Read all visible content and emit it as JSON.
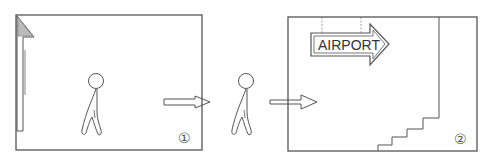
{
  "panels": [
    {
      "id": 1,
      "number_label": "①",
      "description": "Person walking out of a room through a doorway; arrow pointing right"
    },
    {
      "id": 2,
      "number_label": "②",
      "description": "Room with AIRPORT direction sign pointing right and a staircase in the lower right",
      "sign_text": "AIRPORT"
    }
  ],
  "transition": {
    "description": "Person walking between panels with arrows indicating movement to the right"
  },
  "colors": {
    "line": "#555555",
    "background": "#ffffff",
    "hatch": "#999999"
  }
}
